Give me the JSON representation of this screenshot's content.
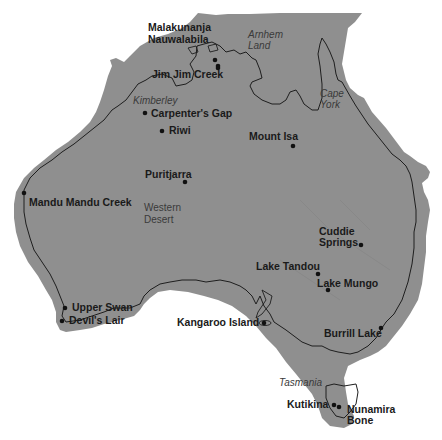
{
  "map": {
    "colors": {
      "land": "#8f8f8f",
      "sea": "#ffffff",
      "coastline": "#1e1e1e",
      "label": "#1a1a1a",
      "region_label": "#3a3a3a"
    },
    "regions": [
      {
        "id": "arnhem-land",
        "lines": [
          "Arnhem",
          "Land"
        ],
        "x": 248,
        "y": 38
      },
      {
        "id": "kimberley",
        "lines": [
          "Kimberley"
        ],
        "x": 133,
        "y": 104
      },
      {
        "id": "cape-york",
        "lines": [
          "Cape",
          "York"
        ],
        "x": 320,
        "y": 97
      },
      {
        "id": "tasmania",
        "lines": [
          "Tasmania"
        ],
        "x": 279,
        "y": 386
      }
    ],
    "desert": {
      "lines": [
        "Western",
        "Desert"
      ],
      "x": 144,
      "y": 211
    },
    "sites": [
      {
        "id": "malakunanja",
        "label": "Malakunanja",
        "dot": [
          215,
          60
        ],
        "lx": 148,
        "ly": 31
      },
      {
        "id": "nauwalabila",
        "label": "Nauwalabila",
        "dot": [
          218,
          66
        ],
        "lx": 148,
        "ly": 43
      },
      {
        "id": "jim-jim-creek",
        "label": "Jim Jim Creek",
        "dot": [
          218,
          68
        ],
        "lx": 152,
        "ly": 78
      },
      {
        "id": "carpenters-gap",
        "label": "Carpenter's Gap",
        "dot": [
          145,
          113
        ],
        "lx": 151,
        "ly": 117
      },
      {
        "id": "riwi",
        "label": "Riwi",
        "dot": [
          162,
          131
        ],
        "lx": 169,
        "ly": 134
      },
      {
        "id": "mount-isa",
        "label": "Mount Isa",
        "dot": [
          293,
          146
        ],
        "lx": 249,
        "ly": 140
      },
      {
        "id": "puritjarra",
        "label": "Puritjarra",
        "dot": [
          185,
          182
        ],
        "lx": 145,
        "ly": 178
      },
      {
        "id": "mandu-mandu-creek",
        "label": "Mandu Mandu Creek",
        "dot": [
          24,
          193
        ],
        "lx": 29,
        "ly": 206
      },
      {
        "id": "cuddie-springs-1",
        "label": "Cuddie",
        "dot": [
          361,
          245
        ],
        "lx": 319,
        "ly": 235
      },
      {
        "id": "cuddie-springs-2",
        "label": "Springs",
        "dot": null,
        "lx": 319,
        "ly": 246
      },
      {
        "id": "lake-tandou",
        "label": "Lake Tandou",
        "dot": [
          318,
          274
        ],
        "lx": 256,
        "ly": 270
      },
      {
        "id": "lake-mungo",
        "label": "Lake Mungo",
        "dot": [
          328,
          290
        ],
        "lx": 317,
        "ly": 287
      },
      {
        "id": "upper-swan",
        "label": "Upper Swan",
        "dot": [
          65,
          308
        ],
        "lx": 72,
        "ly": 311
      },
      {
        "id": "devils-lair",
        "label": "Devil's Lair",
        "dot": [
          62,
          321
        ],
        "lx": 69,
        "ly": 324
      },
      {
        "id": "kangaroo-island",
        "label": "Kangaroo Island",
        "dot": [
          264,
          323
        ],
        "lx": 177,
        "ly": 326
      },
      {
        "id": "burrill-lake",
        "label": "Burrill Lake",
        "dot": [
          381,
          328
        ],
        "lx": 324,
        "ly": 337
      },
      {
        "id": "kutikina",
        "label": "Kutikina",
        "dot": [
          334,
          405
        ],
        "lx": 287,
        "ly": 408
      },
      {
        "id": "nunamira",
        "label": "Nunamira",
        "dot": [
          339,
          407
        ],
        "lx": 347,
        "ly": 413
      },
      {
        "id": "bone-cave",
        "label": "Bone",
        "dot": null,
        "lx": 347,
        "ly": 424
      }
    ]
  }
}
